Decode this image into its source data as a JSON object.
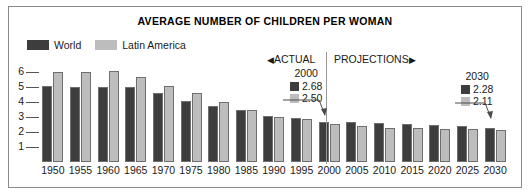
{
  "chart_data": {
    "type": "bar",
    "title": "AVERAGE NUMBER OF CHILDREN PER WOMAN",
    "xlabel": "",
    "ylabel": "",
    "ylim": [
      0,
      6.5
    ],
    "yticks": [
      1,
      2,
      3,
      4,
      5,
      6
    ],
    "grid": true,
    "legend_position": "top-left",
    "categories": [
      "1950",
      "1955",
      "1960",
      "1965",
      "1970",
      "1975",
      "1980",
      "1985",
      "1990",
      "1995",
      "2000",
      "2005",
      "2010",
      "2015",
      "2020",
      "2025",
      "2030"
    ],
    "series": [
      {
        "name": "World",
        "color": "#3d3d3d",
        "values": [
          5.02,
          4.97,
          5.0,
          4.98,
          4.55,
          4.07,
          3.7,
          3.44,
          3.04,
          2.9,
          2.68,
          2.63,
          2.58,
          2.5,
          2.44,
          2.36,
          2.28
        ]
      },
      {
        "name": "Latin America",
        "color": "#bdbdbd",
        "values": [
          5.95,
          5.95,
          6.06,
          5.65,
          5.04,
          4.55,
          3.98,
          3.42,
          2.99,
          2.82,
          2.5,
          2.42,
          2.26,
          2.25,
          2.2,
          2.17,
          2.11
        ]
      }
    ],
    "annotations": [
      {
        "id": "actual",
        "text": "ACTUAL",
        "arrow": "◀",
        "arrow_position": "left"
      },
      {
        "id": "projections",
        "text": "PROJECTIONS",
        "arrow": "▶",
        "arrow_position": "right"
      },
      {
        "id": "callout-2000",
        "year": "2000",
        "world_value": "2.68",
        "latin_value": "2.50"
      },
      {
        "id": "callout-2030",
        "year": "2030",
        "world_value": "2.28",
        "latin_value": "2.11"
      }
    ]
  },
  "legend": {
    "items": [
      {
        "label": "World",
        "color": "#3d3d3d"
      },
      {
        "label": "Latin America",
        "color": "#bdbdbd"
      }
    ]
  },
  "colors": {
    "world": "#3d3d3d",
    "latin_america": "#bdbdbd",
    "frame": "#8a8a8a",
    "divider": "#9a9a9a",
    "text": "#1a1a1a",
    "background": "#ffffff"
  }
}
